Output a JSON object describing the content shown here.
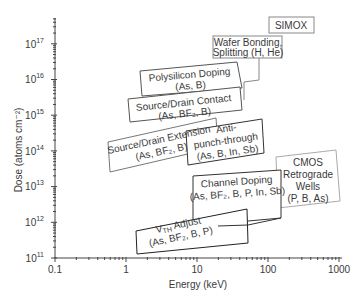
{
  "chart_data": {
    "type": "region-map",
    "title": "",
    "xlabel": "Energy (keV)",
    "ylabel": "Dose (atoms cm⁻²)",
    "xscale": "log",
    "yscale": "log",
    "xlim": [
      0.1,
      1000
    ],
    "ylim": [
      100000000000.0,
      1e+17
    ],
    "x_ticks": [
      "0.1",
      "1",
      "10",
      "100",
      "1000"
    ],
    "y_ticks": [
      {
        "base": "10",
        "exp": "11"
      },
      {
        "base": "10",
        "exp": "12"
      },
      {
        "base": "10",
        "exp": "13"
      },
      {
        "base": "10",
        "exp": "14"
      },
      {
        "base": "10",
        "exp": "15"
      },
      {
        "base": "10",
        "exp": "16"
      },
      {
        "base": "10",
        "exp": "17"
      }
    ],
    "regions": [
      {
        "name": "SIMOX",
        "lines": [
          "SIMOX"
        ],
        "energy_keV": [
          150,
          600
        ],
        "dose": [
          3e+17,
          6e+17
        ]
      },
      {
        "name": "Wafer Bonding, Splitting",
        "lines": [
          "Wafer Bonding,",
          "Splitting (H, He)"
        ],
        "species": [
          "H",
          "He"
        ],
        "energy_keV": [
          20,
          100
        ],
        "dose": [
          5e+16,
          3e+17
        ]
      },
      {
        "name": "Polysilicon Doping",
        "lines": [
          "Polysilicon Doping",
          "(As, B)"
        ],
        "species": [
          "As",
          "B"
        ],
        "energy_keV": [
          2.5,
          50
        ],
        "dose": [
          3000000000000000.0,
          2e+16
        ]
      },
      {
        "name": "Source/Drain Contact",
        "lines": [
          "Source/Drain Contact",
          "(As, BF₂, B)"
        ],
        "species": [
          "As",
          "BF2",
          "B"
        ],
        "energy_keV": [
          1.2,
          15
        ],
        "dose": [
          1000000000000000.0,
          1e+16
        ]
      },
      {
        "name": "Source/Drain Extension",
        "lines": [
          "Source/Drain Extension",
          "(As, BF₂, B)"
        ],
        "species": [
          "As",
          "BF2",
          "B"
        ],
        "energy_keV": [
          0.6,
          10
        ],
        "dose": [
          100000000000000.0,
          1000000000000000.0
        ]
      },
      {
        "name": "Anti-punch-through",
        "lines": [
          "Anti-",
          "punch-through",
          "(As, B, In, Sb)"
        ],
        "species": [
          "As",
          "B",
          "In",
          "Sb"
        ],
        "energy_keV": [
          8,
          100
        ],
        "dose": [
          20000000000000.0,
          300000000000000.0
        ]
      },
      {
        "name": "Channel Doping",
        "lines": [
          "Channel Doping",
          "(As, BF₂, B, P, In, Sb)"
        ],
        "species": [
          "As",
          "BF2",
          "B",
          "P",
          "In",
          "Sb"
        ],
        "energy_keV": [
          10,
          100
        ],
        "dose": [
          1000000000000.0,
          10000000000000.0
        ]
      },
      {
        "name": "CMOS Retrograde Wells",
        "lines": [
          "CMOS",
          "Retrograde",
          "Wells",
          "(P, B, As)"
        ],
        "species": [
          "P",
          "B",
          "As"
        ],
        "energy_keV": [
          100,
          1000
        ],
        "dose": [
          1000000000000.0,
          10000000000000.0
        ]
      },
      {
        "name": "VTH Adjust",
        "lines": [
          "V",
          "TH",
          " Adjust",
          "(As, BF₂, B, P)"
        ],
        "species": [
          "As",
          "BF2",
          "B",
          "P"
        ],
        "energy_keV": [
          1.5,
          50
        ],
        "dose": [
          100000000000.0,
          3000000000000.0
        ]
      }
    ],
    "grid": false,
    "legend": "none"
  }
}
